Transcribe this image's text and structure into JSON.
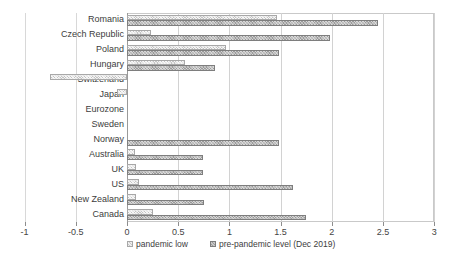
{
  "chart_data": {
    "type": "bar",
    "orientation": "horizontal",
    "title": "",
    "xlabel": "",
    "ylabel": "",
    "xlim": [
      -1,
      3
    ],
    "xticks": [
      "-1",
      "-0.5",
      "0",
      "0.5",
      "1",
      "1.5",
      "2",
      "2.5",
      "3"
    ],
    "xtick_values": [
      -1,
      -0.5,
      0,
      0.5,
      1,
      1.5,
      2,
      2.5,
      3
    ],
    "grid": true,
    "legend_position": "bottom-left",
    "categories": [
      "Romania",
      "Czech Republic",
      "Poland",
      "Hungary",
      "Switzerland",
      "Japan",
      "Eurozone",
      "Sweden",
      "Norway",
      "Australia",
      "UK",
      "US",
      "New Zealand",
      "Canada"
    ],
    "series": [
      {
        "name": "pandemic low",
        "color": "#c4c4c4",
        "values": [
          1.46,
          0.23,
          0.97,
          0.57,
          -0.75,
          -0.1,
          0,
          0,
          0,
          0.08,
          0.09,
          0.12,
          0.09,
          0.25
        ]
      },
      {
        "name": "pre-pandemic level (Dec 2019)",
        "color": "#9b9b9b",
        "values": [
          2.45,
          1.98,
          1.48,
          0.86,
          0,
          0,
          0,
          0,
          1.48,
          0.74,
          0.74,
          1.62,
          0.75,
          1.75
        ]
      }
    ]
  },
  "legend": {
    "items": [
      {
        "label": "pandemic low",
        "swatch": "low"
      },
      {
        "label": "pre-pandemic level (Dec 2019)",
        "swatch": "pre"
      }
    ]
  }
}
